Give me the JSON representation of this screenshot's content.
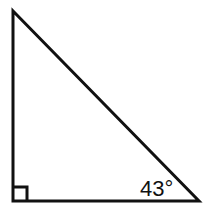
{
  "figure": {
    "background_color": "#ffffff",
    "stroke_color": "#111111",
    "stroke_width": 3,
    "width": 211,
    "height": 214
  },
  "triangle": {
    "shape_name": "right-triangle",
    "vertices": {
      "apex": {
        "label": "top-vertex",
        "x": 13,
        "y": 11
      },
      "right_angle": {
        "label": "bottom-left-vertex",
        "x": 13,
        "y": 201
      },
      "base_right": {
        "label": "bottom-right-vertex",
        "x": 199,
        "y": 201
      }
    },
    "sides": {
      "vertical_leg": {
        "name": "left-leg",
        "length_px": 190
      },
      "horizontal_leg": {
        "name": "bottom-leg",
        "length_px": 186
      },
      "hypotenuse": {
        "name": "hypotenuse"
      }
    }
  },
  "markers": {
    "right_angle_square": {
      "name": "right-angle-marker",
      "size_px": 14,
      "x": 13,
      "y": 187,
      "measure": "90"
    }
  },
  "labels": {
    "angle_bottom_right": {
      "name": "angle-label",
      "text": "43°",
      "value": 43,
      "unit": "degrees",
      "x": 140,
      "y": 196
    }
  }
}
